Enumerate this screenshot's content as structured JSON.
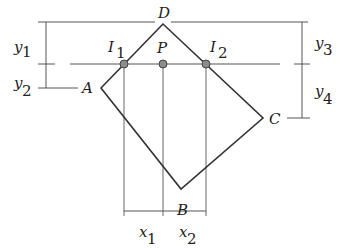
{
  "diagram": {
    "colors": {
      "line": "#333333",
      "thin_line": "#555555",
      "point_fill": "#8c8c8c",
      "point_stroke": "#444444"
    },
    "vertices": [
      {
        "name": "D",
        "x": 163,
        "y": 24
      },
      {
        "name": "A",
        "x": 101,
        "y": 88
      },
      {
        "name": "B",
        "x": 181,
        "y": 189
      },
      {
        "name": "C",
        "x": 263,
        "y": 118
      }
    ],
    "points": [
      {
        "name": "I",
        "sub": "1",
        "x": 124,
        "y": 64
      },
      {
        "name": "P",
        "sub": "",
        "x": 163,
        "y": 64
      },
      {
        "name": "I",
        "sub": "2",
        "x": 206,
        "y": 64
      }
    ],
    "labels": {
      "D": "D",
      "A": "A",
      "B": "B",
      "C": "C",
      "P": "P",
      "I1_main": "I",
      "I1_sub": "1",
      "I2_main": "I",
      "I2_sub": "2",
      "y1_main": "y",
      "y1_sub": "1",
      "y2_main": "y",
      "y2_sub": "2",
      "y3_main": "y",
      "y3_sub": "3",
      "y4_main": "y",
      "y4_sub": "4",
      "x1_main": "x",
      "x1_sub": "1",
      "x2_main": "x",
      "x2_sub": "2"
    },
    "dimensions": {
      "y1": "distance from top line (through D) to scan line (through I1, P, I2)",
      "y2": "distance from scan line to vertex A",
      "y3": "distance from top line to scan line",
      "y4": "distance from scan line to vertex C",
      "x1": "horizontal distance from I1 to P",
      "x2": "horizontal distance from P to I2"
    }
  }
}
